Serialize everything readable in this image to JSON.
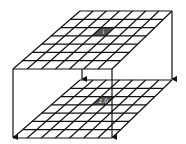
{
  "diagram": {
    "type": "two stacked 7x7 grid planes connected by downward arrows",
    "grid_size": 7,
    "upper_plane": {
      "highlighted_cell": {
        "row": 2,
        "col": 3,
        "label": "i",
        "color": "#555555"
      },
      "corners": {
        "back_left": [
          80,
          11
        ],
        "back_right": [
          172,
          11
        ],
        "front_right": [
          112,
          69
        ],
        "front_left": [
          13,
          69
        ]
      }
    },
    "lower_plane": {
      "highlighted_cell": {
        "row": 2,
        "col": 3,
        "label": "2.0",
        "color": "#555555"
      },
      "corners": {
        "back_left": [
          80,
          80
        ],
        "back_right": [
          172,
          80
        ],
        "front_right": [
          112,
          138
        ],
        "front_left": [
          13,
          138
        ]
      }
    },
    "arrows": [
      {
        "name": "left-arrow",
        "x1": 13,
        "y1": 69,
        "x2": 13,
        "y2": 138
      },
      {
        "name": "middle-arrow",
        "x1": 82,
        "y1": 69,
        "x2": 82,
        "y2": 80
      },
      {
        "name": "front-right-arrow",
        "x1": 112,
        "y1": 69,
        "x2": 112,
        "y2": 138
      },
      {
        "name": "back-right-arrow",
        "x1": 172,
        "y1": 11,
        "x2": 172,
        "y2": 80
      }
    ],
    "line_color": "#111111",
    "background": "#ffffff"
  }
}
